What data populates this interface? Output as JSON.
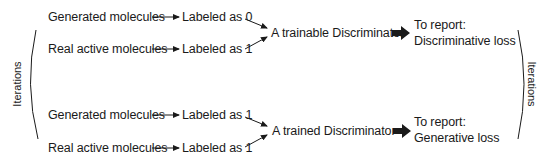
{
  "diagram": {
    "side_label_left": "Iterations",
    "side_label_right": "Iterations",
    "phase1": {
      "input_top": "Generated molecules",
      "label_top": "Labeled as 0",
      "input_bottom": "Real active molecules",
      "label_bottom": "Labeled as 1",
      "model": "A trainable Discriminator",
      "report_heading": "To report:",
      "report_value": "Discriminative loss"
    },
    "phase2": {
      "input_top": "Generated molecules",
      "label_top": "Labeled as 1",
      "input_bottom": "Real active molecules",
      "label_bottom": "Labeled as 1",
      "model": "A trained Discriminator",
      "report_heading": "To report:",
      "report_value": "Generative loss"
    },
    "colors": {
      "text": "#1a1a1a",
      "arrow": "#1a1a1a",
      "background": "#ffffff"
    }
  }
}
